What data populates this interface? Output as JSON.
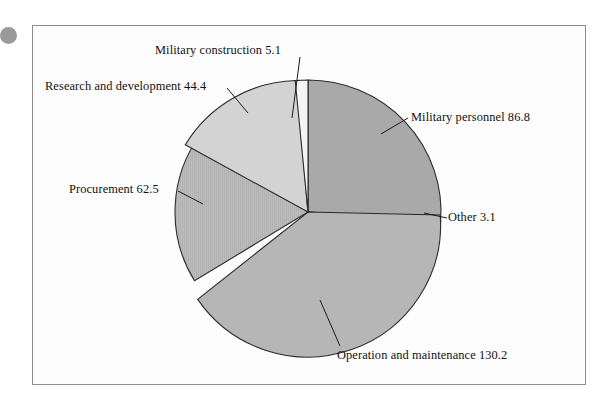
{
  "figure": {
    "background_color": "#ffffff",
    "frame_color": "#8e8e8e",
    "scan_dot_color": "#9a9a9a"
  },
  "chart_data": {
    "type": "pie",
    "title": "",
    "subtitle": "",
    "xlabel": "",
    "ylabel": "",
    "legend_position": "none",
    "grid": false,
    "labels_inline": true,
    "total": 332.1,
    "start_angle_deg": -90,
    "direction": "clockwise",
    "categories": [
      "Military personnel",
      "Other",
      "Operation and maintenance",
      "Procurement",
      "Research and development",
      "Military construction"
    ],
    "values": [
      86.8,
      3.1,
      130.2,
      62.5,
      44.4,
      5.1
    ],
    "slices": [
      {
        "name": "Military personnel",
        "value": 86.8,
        "label": "Military personnel 86.8",
        "color": "#a9a9a9",
        "percent": 26.1
      },
      {
        "name": "Other",
        "value": 3.1,
        "label": "Other 3.1",
        "color": "#f4f4f4",
        "percent": 0.9
      },
      {
        "name": "Operation and maintenance",
        "value": 130.2,
        "label": "Operation and maintenance 130.2",
        "color": "#b6b6b6",
        "percent": 39.2
      },
      {
        "name": "Procurement",
        "value": 62.5,
        "label": "Procurement 62.5",
        "color": "#bcbcbc",
        "percent": 18.8
      },
      {
        "name": "Research and development",
        "value": 44.4,
        "label": "Research and development 44.4",
        "color": "#d3d3d3",
        "percent": 13.4
      },
      {
        "name": "Military construction",
        "value": 5.1,
        "label": "Military construction 5.1",
        "color": "#f4f4f4",
        "percent": 1.5
      }
    ],
    "annotations": [
      "Military construction 5.1",
      "Research and development 44.4",
      "Military personnel 86.8",
      "Procurement 62.5",
      "Other 3.1",
      "Operation and maintenance 130.2"
    ]
  }
}
